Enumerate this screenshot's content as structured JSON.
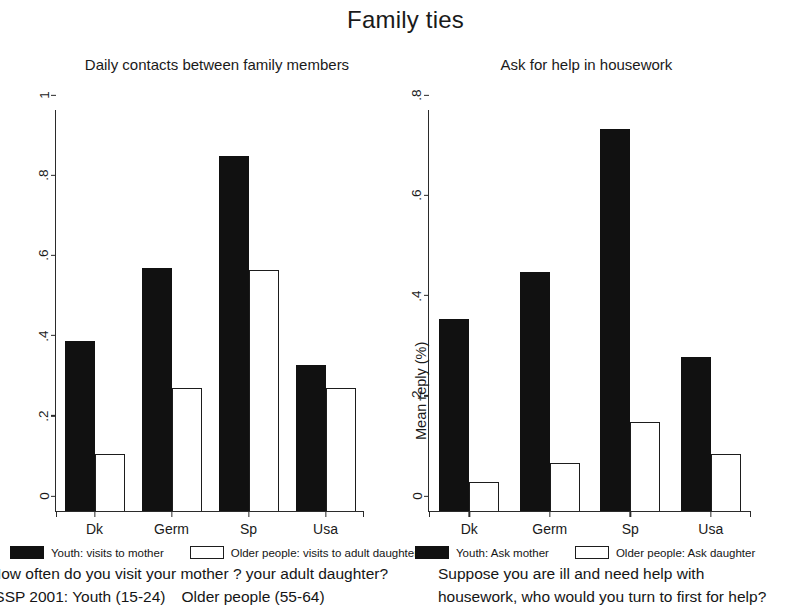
{
  "figure": {
    "title": "Family ties"
  },
  "panels": [
    {
      "id": "daily-contacts",
      "title": "Daily contacts between family members",
      "ylabel": "Mean reply (%)",
      "yticks": [
        "0",
        ".2",
        ".4",
        ".6",
        ".8",
        "1"
      ],
      "categories": [
        "Dk",
        "Germ",
        "Sp",
        "Usa"
      ],
      "legend": [
        {
          "label": "Youth: visits to mother",
          "style": "dark"
        },
        {
          "label": "Older people: visits to adult daughter",
          "style": "light"
        }
      ],
      "caption_line1": "How often do you visit your mother ? your adult daughter?",
      "caption_line2a": "ISSP 2001: Youth (15-24)",
      "caption_line2b": "Older people (55-64)"
    },
    {
      "id": "ask-for-help",
      "title": "Ask for help in housework",
      "ylabel": "Mean reply (%)",
      "yticks": [
        "0",
        ".2",
        ".4",
        ".6",
        ".8"
      ],
      "categories": [
        "Dk",
        "Germ",
        "Sp",
        "Usa"
      ],
      "legend": [
        {
          "label": "Youth: Ask mother",
          "style": "dark"
        },
        {
          "label": "Older people: Ask daughter",
          "style": "light"
        }
      ],
      "caption_line1": "Suppose you are ill and need help with",
      "caption_line2a": "housework, who would you turn to first for help?",
      "caption_line2b": ""
    }
  ],
  "chart_data": [
    {
      "type": "bar",
      "title": "Daily contacts between family members",
      "xlabel": "",
      "ylabel": "Mean reply (%)",
      "ylim": [
        0,
        1
      ],
      "yticks": [
        0,
        0.2,
        0.4,
        0.6,
        0.8,
        1
      ],
      "grid": false,
      "legend_position": "bottom",
      "categories": [
        "Dk",
        "Germ",
        "Sp",
        "Usa"
      ],
      "series": [
        {
          "name": "Youth: visits to mother",
          "values": [
            0.425,
            0.605,
            0.885,
            0.365
          ],
          "color": "#111111"
        },
        {
          "name": "Older people: visits to adult daughter",
          "values": [
            0.142,
            0.307,
            0.6,
            0.307
          ],
          "color": "#ffffff"
        }
      ],
      "annotations": [
        "How often do you visit your mother ? your adult daughter?",
        "ISSP 2001: Youth (15-24)   Older people (55-64)"
      ]
    },
    {
      "type": "bar",
      "title": "Ask for help in housework",
      "xlabel": "",
      "ylabel": "Mean reply (%)",
      "ylim": [
        0,
        0.8
      ],
      "yticks": [
        0,
        0.2,
        0.4,
        0.6,
        0.8
      ],
      "grid": false,
      "legend_position": "bottom",
      "categories": [
        "Dk",
        "Germ",
        "Sp",
        "Usa"
      ],
      "series": [
        {
          "name": "Youth: Ask mother",
          "values": [
            0.383,
            0.477,
            0.762,
            0.307
          ],
          "color": "#111111"
        },
        {
          "name": "Older people: Ask daughter",
          "values": [
            0.058,
            0.095,
            0.177,
            0.113
          ],
          "color": "#ffffff"
        }
      ],
      "annotations": [
        "Suppose you are ill and need help with",
        "housework, who would you turn to first for help?"
      ]
    }
  ],
  "suptitle": "Family ties"
}
